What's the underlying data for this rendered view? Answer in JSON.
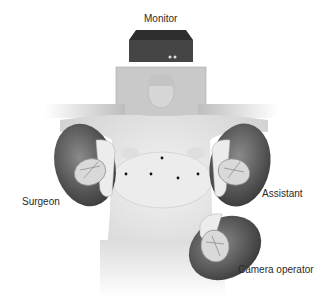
{
  "diagram": {
    "type": "operating-room-setup",
    "labels": {
      "monitor": "Monitor",
      "surgeon": "Surgeon",
      "assistant": "Assistant",
      "camera_operator": "Camera operator"
    },
    "port_sites": [
      {
        "x": 162,
        "y": 158
      },
      {
        "x": 126,
        "y": 174
      },
      {
        "x": 151,
        "y": 174
      },
      {
        "x": 178,
        "y": 178
      },
      {
        "x": 198,
        "y": 174
      }
    ],
    "colors": {
      "monitor": "#3a3a3a",
      "table": "#c8c8c8",
      "skin": "#e4e4e4",
      "staff": "#5a5a5a",
      "port": "#111111"
    }
  }
}
